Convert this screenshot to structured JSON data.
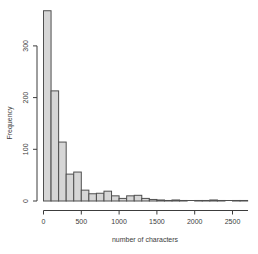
{
  "chart_data": {
    "type": "bar",
    "subtype": "histogram",
    "title": "",
    "xlabel": "number of characters",
    "ylabel": "Frequency",
    "bin_width": 100,
    "bin_starts": [
      0,
      100,
      200,
      300,
      400,
      500,
      600,
      700,
      800,
      900,
      1000,
      1100,
      1200,
      1300,
      1400,
      1500,
      1600,
      1700,
      1800,
      1900,
      2000,
      2100,
      2200,
      2300,
      2400,
      2500,
      2600
    ],
    "counts": [
      368,
      213,
      114,
      52,
      56,
      21,
      14,
      15,
      19,
      10,
      5,
      10,
      11,
      5,
      3,
      2,
      1,
      2,
      1,
      0,
      1,
      1,
      2,
      1,
      0,
      1,
      1
    ],
    "x_ticks": [
      0,
      500,
      1000,
      1500,
      2000,
      2500
    ],
    "x_tick_labels": [
      "0",
      "500",
      "1000",
      "1500",
      "2000",
      "2500"
    ],
    "y_ticks": [
      0,
      100,
      200,
      300
    ],
    "y_tick_labels": [
      "0",
      "100",
      "200",
      "300"
    ],
    "xlim": [
      0,
      2700
    ],
    "ylim": [
      0,
      380
    ],
    "grid": false,
    "legend": "none",
    "bar_fill": "#d6d6d6",
    "bar_border": "#4f4f4f",
    "axis_color": "#3c3c3c",
    "background": "#ffffff"
  }
}
